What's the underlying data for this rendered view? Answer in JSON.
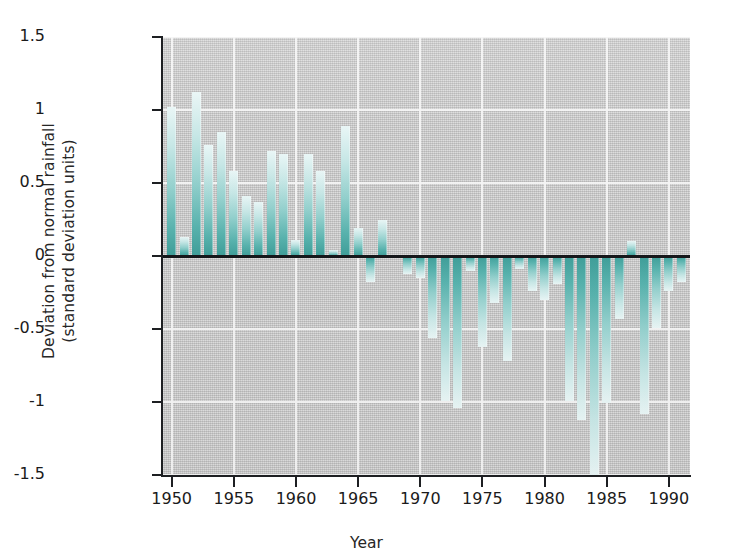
{
  "chart_data": {
    "type": "bar",
    "title": "",
    "xlabel": "Year",
    "ylabel_line1": "Deviation from normal rainfall",
    "ylabel_line2": "(standard deviation units)",
    "ylim": [
      -1.5,
      1.5
    ],
    "xlim": [
      1949.3,
      1991.7
    ],
    "yticks": [
      1.5,
      1,
      0.5,
      0,
      -0.5,
      -1,
      -1.5
    ],
    "ytick_labels": [
      "1.5",
      "1",
      "0.5",
      "0",
      "-0.5",
      "-1",
      "-1.5"
    ],
    "xticks": [
      1950,
      1955,
      1960,
      1965,
      1970,
      1975,
      1980,
      1985,
      1990
    ],
    "xtick_labels": [
      "1950",
      "1955",
      "1960",
      "1965",
      "1970",
      "1975",
      "1980",
      "1985",
      "1990"
    ],
    "grid": true,
    "grid_color": "#f4f4f4",
    "plot_background": "#c9c9c9",
    "bar_color_top": "#e9f6f6",
    "bar_color_bottom": "#3f9e99",
    "zero_line_color": "#15171a",
    "legend": null,
    "categories": [
      1950,
      1951,
      1952,
      1953,
      1954,
      1955,
      1956,
      1957,
      1958,
      1959,
      1960,
      1961,
      1962,
      1963,
      1964,
      1965,
      1966,
      1967,
      1968,
      1969,
      1970,
      1971,
      1972,
      1973,
      1974,
      1975,
      1976,
      1977,
      1978,
      1979,
      1980,
      1981,
      1982,
      1983,
      1984,
      1985,
      1986,
      1987,
      1988,
      1989,
      1990,
      1991
    ],
    "values": [
      1.02,
      0.13,
      1.12,
      0.76,
      0.85,
      0.58,
      0.41,
      0.37,
      0.72,
      0.7,
      0.11,
      0.7,
      0.58,
      0.04,
      0.89,
      0.19,
      -0.18,
      0.25,
      0.01,
      -0.12,
      -0.15,
      -0.56,
      -0.99,
      -1.04,
      -0.1,
      -0.62,
      -0.32,
      -0.72,
      -0.09,
      -0.24,
      -0.3,
      -0.19,
      -0.99,
      -1.12,
      -1.5,
      -1.01,
      -0.43,
      0.1,
      -1.08,
      -0.49,
      -0.24,
      -0.18
    ]
  },
  "axis": {
    "ylabel_line1": "Deviation from normal rainfall",
    "ylabel_line2": "(standard deviation units)",
    "xlabel": "Year"
  }
}
